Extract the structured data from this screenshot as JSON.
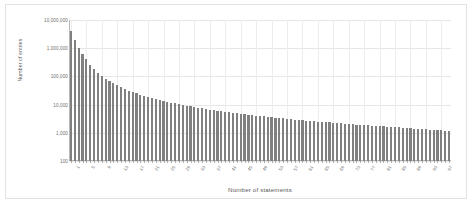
{
  "chart_data": {
    "type": "bar",
    "title": "",
    "xlabel": "Number of statements",
    "ylabel": "Number of entries",
    "yscale": "log",
    "ylim": [
      100,
      10000000
    ],
    "grid": true,
    "legend": false,
    "bar_color": "#808080",
    "y_tick_labels": [
      "10,000,000",
      "1,000,000",
      "100,000",
      "10,000",
      "1,000",
      "100"
    ],
    "y_tick_values": [
      10000000,
      1000000,
      100000,
      10000,
      1000,
      100
    ],
    "x_tick_labels": [
      "1",
      "5",
      "9",
      "13",
      "17",
      "21",
      "25",
      "29",
      "33",
      "37",
      "41",
      "45",
      "49",
      "53",
      "57",
      "61",
      "65",
      "69",
      "73",
      "77",
      "81",
      "85",
      "89",
      "93",
      "97"
    ],
    "x_tick_values": [
      1,
      5,
      9,
      13,
      17,
      21,
      25,
      29,
      33,
      37,
      41,
      45,
      49,
      53,
      57,
      61,
      65,
      69,
      73,
      77,
      81,
      85,
      89,
      93,
      97
    ],
    "categories": [
      1,
      2,
      3,
      4,
      5,
      6,
      7,
      8,
      9,
      10,
      11,
      12,
      13,
      14,
      15,
      16,
      17,
      18,
      19,
      20,
      21,
      22,
      23,
      24,
      25,
      26,
      27,
      28,
      29,
      30,
      31,
      32,
      33,
      34,
      35,
      36,
      37,
      38,
      39,
      40,
      41,
      42,
      43,
      44,
      45,
      46,
      47,
      48,
      49,
      50,
      51,
      52,
      53,
      54,
      55,
      56,
      57,
      58,
      59,
      60,
      61,
      62,
      63,
      64,
      65,
      66,
      67,
      68,
      69,
      70,
      71,
      72,
      73,
      74,
      75,
      76,
      77,
      78,
      79,
      80,
      81,
      82,
      83,
      84,
      85,
      86,
      87,
      88,
      89,
      90,
      91,
      92,
      93,
      94,
      95,
      96,
      97,
      98,
      99
    ],
    "values": [
      4200000,
      1900000,
      1050000,
      620000,
      400000,
      255000,
      180000,
      135000,
      103000,
      83000,
      68000,
      57000,
      48000,
      41000,
      36000,
      31500,
      28000,
      25000,
      22500,
      20500,
      18500,
      17000,
      15600,
      14500,
      13500,
      12600,
      11800,
      11100,
      10400,
      9800,
      9200,
      8700,
      8200,
      7800,
      7400,
      7050,
      6700,
      6400,
      6100,
      5850,
      5600,
      5350,
      5150,
      4950,
      4750,
      4580,
      4400,
      4250,
      4100,
      3950,
      3820,
      3690,
      3570,
      3450,
      3340,
      3240,
      3140,
      3050,
      2960,
      2880,
      2800,
      2720,
      2650,
      2580,
      2510,
      2450,
      2390,
      2330,
      2270,
      2220,
      2160,
      2110,
      2060,
      2010,
      1970,
      1920,
      1880,
      1840,
      1800,
      1760,
      1720,
      1680,
      1650,
      1610,
      1580,
      1550,
      1510,
      1480,
      1450,
      1420,
      1390,
      1360,
      1330,
      1300,
      1270,
      1240,
      1210,
      1180,
      1150
    ]
  }
}
